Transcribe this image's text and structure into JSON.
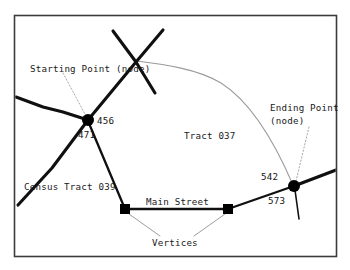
{
  "figure": {
    "background_color": "#ffffff",
    "frame_color": "#3c3c3c",
    "line_color": "#101010",
    "boundary_color": "#9a9a9a",
    "leader_color": "#a8a8a8"
  },
  "annotations": {
    "starting_point": "Starting Point (node)",
    "ending_point_line1": "Ending Point",
    "ending_point_line2": "(node)",
    "vertices": "Vertices",
    "main_street": "Main Street"
  },
  "areas": {
    "tract_right": "Tract 037",
    "tract_left": "Census Tract 039"
  },
  "node_labels": {
    "start_upper_right": "456",
    "start_lower_left": "471",
    "end_upper_left": "542",
    "end_lower_left": "573"
  }
}
